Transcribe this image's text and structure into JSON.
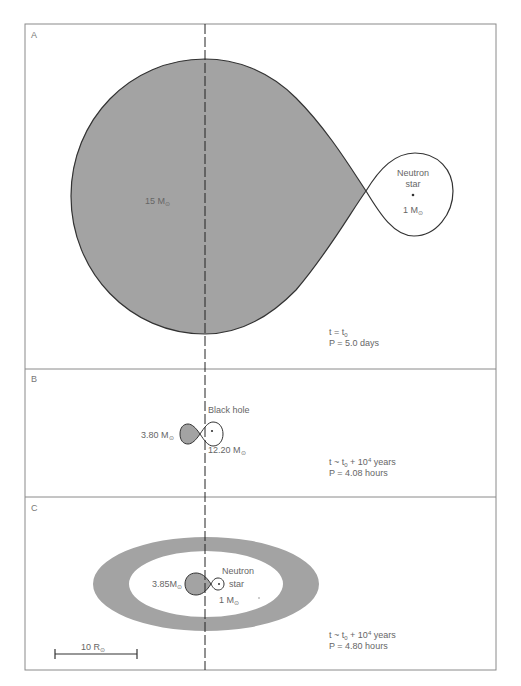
{
  "colors": {
    "frame": "#8a8a8a",
    "fill": "#a3a3a3",
    "outline": "#333333",
    "text": "#666666"
  },
  "panels": [
    {
      "letter": "A",
      "mass_left": "15 M",
      "mass_left_sub": "⊙",
      "companion_name_line1": "Neutron",
      "companion_name_line2": "star",
      "companion_mass": "1 M",
      "companion_mass_sub": "⊙",
      "time_line": "t = t",
      "time_sub": "0",
      "period_line": "P = 5.0 days"
    },
    {
      "letter": "B",
      "mass_left": "3.80 M",
      "mass_left_sub": "⊙",
      "companion_name": "Black hole",
      "companion_mass": "12.20 M",
      "companion_mass_sub": "⊙",
      "time_line_a": "t ~ t",
      "time_sub": "0",
      "time_line_b": " + 10",
      "time_sup": "4",
      "time_line_c": " years",
      "period_line": "P = 4.08 hours"
    },
    {
      "letter": "C",
      "mass_left": "3.85M",
      "mass_left_sub": "⊙",
      "companion_name_line1": "Neutron",
      "companion_name_line2": "star",
      "companion_mass": "1 M",
      "companion_mass_sub": "⊙",
      "time_line_a": "t ~ t",
      "time_sub": "0",
      "time_line_b": " + 10",
      "time_sup": "4",
      "time_line_c": " years",
      "period_line": "P = 4.80 hours",
      "scale_bar_label": "10 R",
      "scale_bar_sub": "⊙"
    }
  ]
}
